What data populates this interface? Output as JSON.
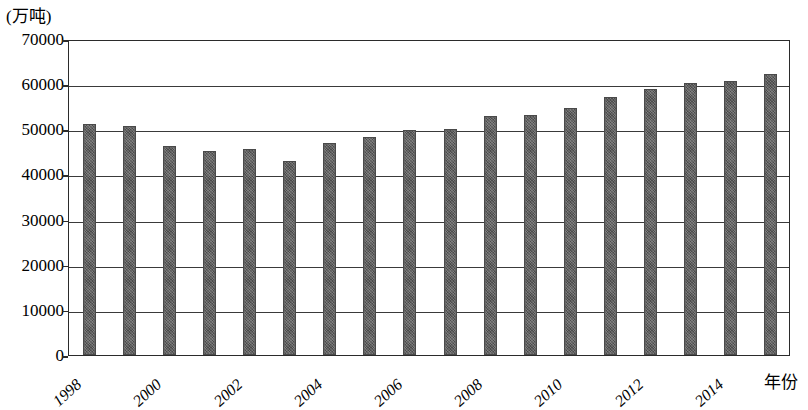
{
  "chart_data": {
    "type": "bar",
    "title": "",
    "subtitle": "",
    "unit_label": "(万吨)",
    "xlabel": "年份",
    "ylabel": "",
    "ylim": [
      0,
      70000
    ],
    "y_tick_step": 10000,
    "grid": true,
    "legend": null,
    "categories": [
      "1998",
      "1999",
      "2000",
      "2001",
      "2002",
      "2003",
      "2004",
      "2005",
      "2006",
      "2007",
      "2008",
      "2009",
      "2010",
      "2011",
      "2012",
      "2013",
      "2014",
      "2015"
    ],
    "visible_x_tick_labels": [
      "1998",
      "2000",
      "2002",
      "2004",
      "2006",
      "2008",
      "2010",
      "2012",
      "2014"
    ],
    "y_tick_labels": [
      "70000",
      "60000",
      "50000",
      "40000",
      "30000",
      "20000",
      "10000",
      "0"
    ],
    "y_tick_values": [
      70000,
      60000,
      50000,
      40000,
      30000,
      20000,
      10000,
      0
    ],
    "values": [
      51230,
      50840,
      46218,
      45264,
      45706,
      43070,
      46947,
      48402,
      49804,
      50160,
      52871,
      53082,
      54648,
      57121,
      58958,
      60194,
      60703,
      62144
    ],
    "series": [
      {
        "name": "粮食产量",
        "values": [
          51230,
          50840,
          46218,
          45264,
          45706,
          43070,
          46947,
          48402,
          49804,
          50160,
          52871,
          53082,
          54648,
          57121,
          58958,
          60194,
          60703,
          62144
        ]
      }
    ],
    "colors": {
      "bar_fill": "#5a5a5a",
      "bar_border": "#4a4a4a",
      "gridline": "#3a3a3a",
      "frame": "#2b2b2b",
      "background": "#ffffff",
      "text": "#000000"
    }
  }
}
